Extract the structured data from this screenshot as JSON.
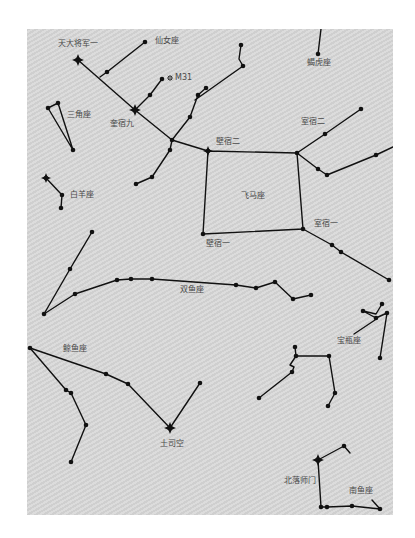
{
  "map": {
    "background": "#d5d5d5",
    "line_color": "#111111",
    "label_color": "#4a4a4a",
    "labels": [
      {
        "id": "tiandajiangjun-yi",
        "text": "天大将军一",
        "x": 58,
        "y": 46
      },
      {
        "id": "andromeda",
        "text": "仙女座",
        "x": 155,
        "y": 43
      },
      {
        "id": "m31",
        "text": "M31",
        "x": 175,
        "y": 80
      },
      {
        "id": "triangulum",
        "text": "三角座",
        "x": 67,
        "y": 117
      },
      {
        "id": "kuisu-jiu",
        "text": "奎宿九",
        "x": 110,
        "y": 126
      },
      {
        "id": "lacerta",
        "text": "蝎虎座",
        "x": 307,
        "y": 65
      },
      {
        "id": "shisu-er",
        "text": "室宿二",
        "x": 301,
        "y": 124
      },
      {
        "id": "bisu-er",
        "text": "壁宿二",
        "x": 216,
        "y": 144
      },
      {
        "id": "aries",
        "text": "白羊座",
        "x": 70,
        "y": 197
      },
      {
        "id": "pegasus",
        "text": "飞马座",
        "x": 241,
        "y": 198
      },
      {
        "id": "shisu-yi",
        "text": "室宿一",
        "x": 314,
        "y": 226
      },
      {
        "id": "bisu-yi",
        "text": "壁宿一",
        "x": 206,
        "y": 246
      },
      {
        "id": "pisces",
        "text": "双鱼座",
        "x": 180,
        "y": 292
      },
      {
        "id": "cetus",
        "text": "鲸鱼座",
        "x": 63,
        "y": 351
      },
      {
        "id": "aquarius",
        "text": "宝瓶座",
        "x": 337,
        "y": 343
      },
      {
        "id": "tusikong",
        "text": "土司空",
        "x": 160,
        "y": 446
      },
      {
        "id": "beiluoshimen",
        "text": "北落师门",
        "x": 284,
        "y": 483
      },
      {
        "id": "piscis-austrinus",
        "text": "南鱼座",
        "x": 349,
        "y": 493
      }
    ],
    "bright_stars": [
      {
        "name": "tiandajiangjun-yi-star",
        "x": 78,
        "y": 60,
        "r": 6
      },
      {
        "name": "kuisu-jiu-star",
        "x": 135,
        "y": 110,
        "r": 6
      },
      {
        "name": "bisu-er-star",
        "x": 208,
        "y": 151,
        "r": 5
      },
      {
        "name": "aries-bright-star",
        "x": 46,
        "y": 178,
        "r": 5
      },
      {
        "name": "tusikong-star",
        "x": 170,
        "y": 428,
        "r": 6
      },
      {
        "name": "beiluoshimen-star",
        "x": 318,
        "y": 460,
        "r": 6
      }
    ],
    "m31_marker": {
      "x": 170,
      "y": 78
    },
    "constellations": [
      {
        "name": "andromeda",
        "lines": [
          [
            [
              78,
              60
            ],
            [
              135,
              110
            ],
            [
              172,
              140
            ],
            [
              208,
              151
            ]
          ],
          [
            [
              100,
              77
            ],
            [
              107,
              72
            ],
            [
              145,
              42
            ]
          ],
          [
            [
              135,
              110
            ],
            [
              150,
              95
            ],
            [
              162,
              79
            ]
          ],
          [
            [
              172,
              140
            ],
            [
              190,
              117
            ],
            [
              198,
              95
            ],
            [
              206,
              88
            ]
          ],
          [
            [
              172,
              140
            ],
            [
              170,
              150
            ],
            [
              152,
              177
            ],
            [
              136,
              184
            ]
          ]
        ]
      },
      {
        "name": "triangulum",
        "lines": [
          [
            [
              48,
              108
            ],
            [
              58,
              103
            ],
            [
              73,
              150
            ],
            [
              48,
              108
            ]
          ]
        ]
      },
      {
        "name": "aries",
        "lines": [
          [
            [
              46,
              178
            ],
            [
              62,
              195
            ],
            [
              61,
              208
            ]
          ]
        ]
      },
      {
        "name": "lacerta",
        "lines": [
          [
            [
              321,
              29
            ],
            [
              318,
              54
            ]
          ],
          [
            [
              241,
              45
            ],
            [
              239,
              59
            ],
            [
              243,
              66
            ],
            [
              195,
              100
            ]
          ]
        ]
      },
      {
        "name": "pegasus",
        "lines": [
          [
            [
              208,
              151
            ],
            [
              297,
              153
            ],
            [
              303,
              229
            ],
            [
              203,
              234
            ],
            [
              208,
              151
            ]
          ],
          [
            [
              297,
              153
            ],
            [
              325,
              134
            ],
            [
              361,
              109
            ]
          ],
          [
            [
              297,
              153
            ],
            [
              318,
              169
            ],
            [
              327,
              175
            ],
            [
              376,
              155
            ],
            [
              393,
              147
            ]
          ],
          [
            [
              303,
              229
            ],
            [
              332,
              245
            ],
            [
              341,
              252
            ],
            [
              389,
              280
            ]
          ]
        ]
      },
      {
        "name": "pisces",
        "lines": [
          [
            [
              44,
              314
            ],
            [
              70,
              269
            ],
            [
              92,
              232
            ]
          ],
          [
            [
              44,
              314
            ],
            [
              75,
              294
            ],
            [
              117,
              280
            ],
            [
              131,
              279
            ],
            [
              152,
              279
            ],
            [
              236,
              285
            ],
            [
              256,
              288
            ],
            [
              275,
              282
            ],
            [
              293,
              299
            ],
            [
              311,
              295
            ]
          ]
        ]
      },
      {
        "name": "cetus",
        "lines": [
          [
            [
              30,
              348
            ],
            [
              106,
              374
            ],
            [
              128,
              384
            ],
            [
              170,
              428
            ],
            [
              200,
              383
            ]
          ],
          [
            [
              30,
              348
            ],
            [
              66,
              390
            ],
            [
              71,
              393
            ],
            [
              86,
              425
            ],
            [
              71,
              462
            ]
          ]
        ]
      },
      {
        "name": "aquarius",
        "lines": [
          [
            [
              382,
              304
            ],
            [
              376,
              314
            ],
            [
              363,
              311
            ],
            [
              376,
              318
            ],
            [
              375,
              320
            ],
            [
              354,
              334
            ]
          ],
          [
            [
              376,
              318
            ],
            [
              387,
              313
            ],
            [
              380,
              358
            ]
          ],
          [
            [
              259,
              398
            ],
            [
              292,
              372
            ],
            [
              294,
              367
            ],
            [
              290,
              365
            ],
            [
              296,
              356
            ],
            [
              295,
              347
            ]
          ],
          [
            [
              296,
              356
            ],
            [
              329,
              356
            ],
            [
              335,
              393
            ],
            [
              328,
              406
            ]
          ]
        ]
      },
      {
        "name": "piscis-austrinus",
        "lines": [
          [
            [
              318,
              460
            ],
            [
              344,
              446
            ],
            [
              350,
              453
            ]
          ],
          [
            [
              318,
              460
            ],
            [
              321,
              507
            ],
            [
              327,
              507
            ],
            [
              352,
              506
            ],
            [
              380,
              509
            ],
            [
              372,
              500
            ]
          ]
        ]
      }
    ],
    "dots": [
      [
        145,
        42
      ],
      [
        107,
        72
      ],
      [
        162,
        79
      ],
      [
        150,
        95
      ],
      [
        206,
        88
      ],
      [
        198,
        95
      ],
      [
        190,
        117
      ],
      [
        172,
        140
      ],
      [
        170,
        150
      ],
      [
        152,
        177
      ],
      [
        136,
        184
      ],
      [
        48,
        108
      ],
      [
        58,
        103
      ],
      [
        73,
        150
      ],
      [
        62,
        195
      ],
      [
        61,
        208
      ],
      [
        318,
        54
      ],
      [
        241,
        45
      ],
      [
        243,
        66
      ],
      [
        297,
        153
      ],
      [
        303,
        229
      ],
      [
        203,
        234
      ],
      [
        325,
        134
      ],
      [
        361,
        109
      ],
      [
        318,
        169
      ],
      [
        327,
        175
      ],
      [
        376,
        155
      ],
      [
        332,
        245
      ],
      [
        341,
        252
      ],
      [
        389,
        280
      ],
      [
        44,
        314
      ],
      [
        70,
        269
      ],
      [
        92,
        232
      ],
      [
        75,
        294
      ],
      [
        117,
        280
      ],
      [
        131,
        279
      ],
      [
        152,
        279
      ],
      [
        236,
        285
      ],
      [
        256,
        288
      ],
      [
        275,
        282
      ],
      [
        293,
        299
      ],
      [
        311,
        295
      ],
      [
        30,
        348
      ],
      [
        106,
        374
      ],
      [
        128,
        384
      ],
      [
        200,
        383
      ],
      [
        66,
        390
      ],
      [
        71,
        393
      ],
      [
        86,
        425
      ],
      [
        71,
        462
      ],
      [
        382,
        304
      ],
      [
        363,
        311
      ],
      [
        387,
        313
      ],
      [
        380,
        358
      ],
      [
        376,
        318
      ],
      [
        259,
        398
      ],
      [
        292,
        372
      ],
      [
        295,
        347
      ],
      [
        296,
        356
      ],
      [
        329,
        356
      ],
      [
        335,
        393
      ],
      [
        328,
        406
      ],
      [
        344,
        446
      ],
      [
        321,
        507
      ],
      [
        327,
        507
      ],
      [
        352,
        506
      ],
      [
        380,
        509
      ]
    ]
  }
}
